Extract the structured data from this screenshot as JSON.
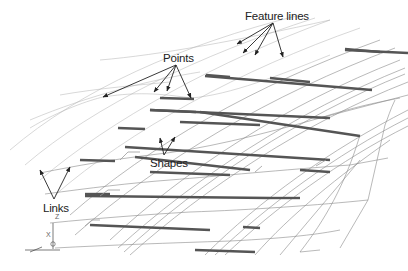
{
  "diagram": {
    "colors": {
      "background": "#ffffff",
      "text": "#222222",
      "wire": "#8a8a8a",
      "wire_faint": "#b0b0b0",
      "shape": "#555555",
      "arrow": "#222222"
    },
    "labels": [
      {
        "id": "feature-lines",
        "text": "Feature lines",
        "x": 245,
        "y": 20
      },
      {
        "id": "points",
        "text": "Points",
        "x": 163,
        "y": 62
      },
      {
        "id": "shapes",
        "text": "Shapes",
        "x": 150,
        "y": 167
      },
      {
        "id": "links",
        "text": "Links",
        "x": 43,
        "y": 212
      }
    ],
    "arrows": {
      "feature-lines": {
        "from": [
          273,
          23
        ],
        "to": [
          [
            237,
            44
          ],
          [
            243,
            53
          ],
          [
            255,
            55
          ],
          [
            283,
            57
          ]
        ]
      },
      "points": {
        "from": [
          176,
          65
        ],
        "to": [
          [
            103,
            97
          ],
          [
            154,
            92
          ],
          [
            167,
            91
          ],
          [
            191,
            98
          ]
        ]
      },
      "shapes": {
        "from": [
          164,
          155
        ],
        "to": [
          [
            160,
            138
          ],
          [
            175,
            137
          ]
        ]
      },
      "links": {
        "from": [
          54,
          199
        ],
        "to": [
          [
            40,
            170
          ],
          [
            70,
            167
          ]
        ]
      }
    },
    "axis_triad": {
      "x_label": "X",
      "z_label": "Z",
      "origin": [
        53,
        249
      ]
    }
  }
}
